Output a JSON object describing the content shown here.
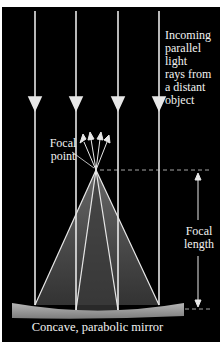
{
  "labels": {
    "incoming_line1": "Incoming",
    "incoming_line2": "parallel",
    "incoming_line3": "light",
    "incoming_line4": "rays from",
    "incoming_line5": "a distant",
    "incoming_line6": "object",
    "focal_point_line1": "Focal",
    "focal_point_line2": "point",
    "focal_length_line1": "Focal",
    "focal_length_line2": "length",
    "mirror": "Concave, parabolic mirror"
  },
  "geometry": {
    "incoming_ray_x": [
      35,
      76,
      118,
      159
    ],
    "focal_point": {
      "x": 96,
      "y": 170
    },
    "mirror_left_x": 12,
    "mirror_right_x": 184
  },
  "colors": {
    "background": "#000000",
    "rays": "#e8e8e8",
    "mirror": "#9a9a9a",
    "cone": "#6b6b6b",
    "text": "#f2f2f2"
  }
}
